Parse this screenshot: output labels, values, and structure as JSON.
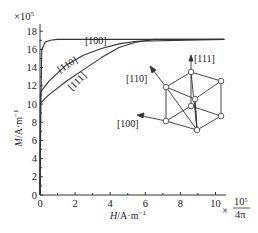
{
  "chart_data": {
    "type": "line",
    "title": "",
    "xlabel": "H/A·m⁻¹",
    "ylabel": "M/A·m⁻¹",
    "x_multiplier": "×10⁵/4π",
    "y_multiplier": "×10⁵",
    "xlim": [
      0,
      10.5
    ],
    "ylim": [
      0,
      18.5
    ],
    "x_ticks": [
      "0",
      "2",
      "4",
      "6",
      "8",
      "10"
    ],
    "y_ticks": [
      "0",
      "2",
      "4",
      "6",
      "8",
      "10",
      "12",
      "14",
      "16",
      "18"
    ],
    "grid": false,
    "series": [
      {
        "name": "[100]",
        "x": [
          0,
          0.05,
          0.1,
          0.3,
          0.6,
          1.0,
          10.5
        ],
        "y": [
          0,
          10,
          16,
          16.8,
          17.0,
          17.1,
          17.1
        ]
      },
      {
        "name": "[110]",
        "x": [
          0,
          0.02,
          0.5,
          1.5,
          2.5,
          3.5,
          4.5,
          5.5,
          10.5
        ],
        "y": [
          0,
          11.3,
          12.5,
          14.3,
          15.4,
          16.1,
          16.6,
          16.9,
          17.1
        ]
      },
      {
        "name": "[111]",
        "x": [
          0,
          0.02,
          0.5,
          1.5,
          2.5,
          3.5,
          4.5,
          5.5,
          6.5,
          10.5
        ],
        "y": [
          0,
          10.1,
          11.0,
          12.5,
          13.8,
          15.1,
          16.2,
          16.8,
          17.1,
          17.1
        ]
      }
    ],
    "annotations": [
      "[100]",
      "[110]",
      "[111]"
    ],
    "inset": {
      "description": "cubic unit cell with crystal direction arrows",
      "arrows": [
        "[100]",
        "[110]",
        "[111]"
      ]
    }
  },
  "axes": {
    "x_label_main": "H",
    "x_label_unit": "/A·m",
    "x_label_exp": "−1",
    "y_label_main": "M",
    "y_label_unit": "/A·m",
    "y_label_exp": "−1",
    "y_mult_base": "×10",
    "y_mult_exp": "5",
    "x_mult_prefix": "×",
    "x_mult_num": "10",
    "x_mult_num_exp": "5",
    "x_mult_den": "4π"
  },
  "curve_labels": {
    "c100": "[100]",
    "c110": "[110]",
    "c111": "[111]"
  },
  "inset_labels": {
    "a110": "[110]",
    "a111": "[111]",
    "a100": "[100]"
  }
}
